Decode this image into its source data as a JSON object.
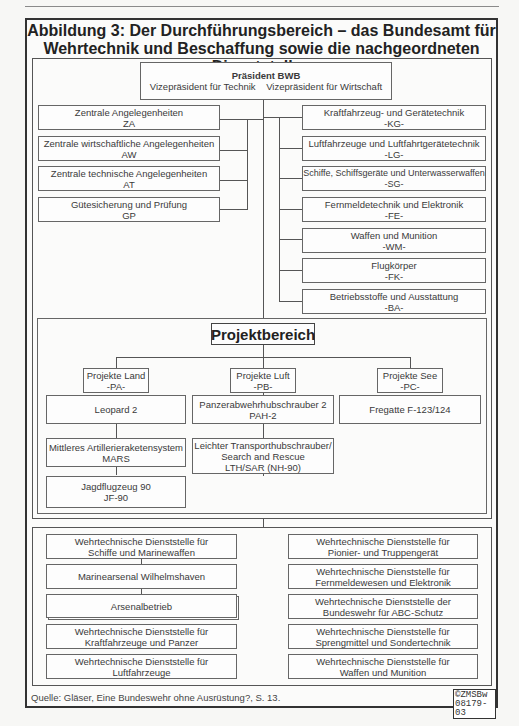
{
  "header": {
    "title_line1": "Abbildung 3: Der Durchführungsbereich – das Bundesamt für",
    "title_line2": "Wehrtechnik und Beschaffung sowie die nachgeordneten Dienststellen"
  },
  "president": {
    "title": "Präsident BWB",
    "vp_technik": "Vizepräsident für Technik",
    "vp_wirtschaft": "Vizepräsident für Wirtschaft"
  },
  "left_departments": [
    {
      "name": "Zentrale Angelegenheiten",
      "code": "ZA"
    },
    {
      "name": "Zentrale wirtschaftliche Angelegenheiten",
      "code": "AW"
    },
    {
      "name": "Zentrale technische Angelegenheiten",
      "code": "AT"
    },
    {
      "name": "Gütesicherung und Prüfung",
      "code": "GP"
    }
  ],
  "right_departments": [
    {
      "name": "Kraftfahrzeug- und Gerätetechnik",
      "code": "-KG-"
    },
    {
      "name": "Luftfahrzeuge und Luftfahrtgerätetechnik",
      "code": "-LG-"
    },
    {
      "name": "Schiffe, Schiffsgeräte und Unterwasserwaffen",
      "code": "-SG-"
    },
    {
      "name": "Fernmeldetechnik und Elektronik",
      "code": "-FE-"
    },
    {
      "name": "Waffen und Munition",
      "code": "-WM-"
    },
    {
      "name": "Flugkörper",
      "code": "-FK-"
    },
    {
      "name": "Betriebsstoffe und Ausstattung",
      "code": "-BA-"
    }
  ],
  "projektbereich": {
    "title": "Projektbereich",
    "groups": [
      {
        "name": "Projekte Land",
        "code": "-PA-",
        "projects": [
          {
            "line1": "Leopard 2",
            "line2": "",
            "line3": ""
          },
          {
            "line1": "Mittleres Artillerieraketensystem",
            "line2": "MARS",
            "line3": ""
          },
          {
            "line1": "Jagdflugzeug 90",
            "line2": "JF-90",
            "line3": ""
          }
        ]
      },
      {
        "name": "Projekte Luft",
        "code": "-PB-",
        "projects": [
          {
            "line1": "Panzerabwehrhubschrauber 2",
            "line2": "PAH-2",
            "line3": ""
          },
          {
            "line1": "Leichter Transporthubschrauber/",
            "line2": "Search and Rescue",
            "line3": "LTH/SAR (NH-90)"
          }
        ]
      },
      {
        "name": "Projekte See",
        "code": "-PC-",
        "projects": [
          {
            "line1": "Fregatte F-123/124",
            "line2": "",
            "line3": ""
          }
        ]
      }
    ]
  },
  "dienststellen": {
    "left": [
      {
        "line1": "Wehrtechnische Dienststelle für",
        "line2": "Schiffe und Marinewaffen"
      },
      {
        "line1": "Marinearsenal Wilhelmshaven",
        "line2": ""
      },
      {
        "line1": "Arsenalbetrieb",
        "line2": ""
      },
      {
        "line1": "Wehrtechnische Dienststelle für",
        "line2": "Kraftfahrzeuge und Panzer"
      },
      {
        "line1": "Wehrtechnische Dienststelle für",
        "line2": "Luftfahrzeuge"
      }
    ],
    "right": [
      {
        "line1": "Wehrtechnische Dienststelle für",
        "line2": "Pionier- und Truppengerät"
      },
      {
        "line1": "Wehrtechnische Dienststelle für",
        "line2": "Fernmeldewesen und Elektronik"
      },
      {
        "line1": "Wehrtechnische Dienststelle der",
        "line2": "Bundeswehr für ABC-Schutz"
      },
      {
        "line1": "Wehrtechnische Dienststelle für",
        "line2": "Sprengmittel und Sondertechnik"
      },
      {
        "line1": "Wehrtechnische Dienststelle für",
        "line2": "Waffen und Munition"
      }
    ]
  },
  "footer": {
    "source": "Quelle: Gläser, Eine Bundeswehr ohne Ausrüstung?, S. 13.",
    "copyright_line1": "©ZMSBw",
    "copyright_line2": "08179-03"
  }
}
